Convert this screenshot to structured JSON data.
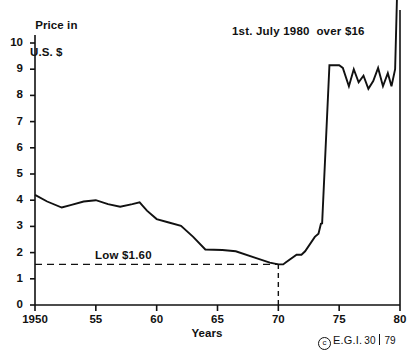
{
  "chart_data": {
    "type": "line",
    "title": "",
    "subtitle": "",
    "xlabel": "Years",
    "ylabel": "Price in U.S. $",
    "ylabel_line1": "Price in",
    "ylabel_line2": "U.S. $",
    "xlim": [
      1950,
      1980
    ],
    "ylim": [
      0,
      10
    ],
    "grid": false,
    "legend": "none",
    "ytick_labels": [
      "0",
      "1",
      "2",
      "3",
      "4",
      "5",
      "6",
      "7",
      "8",
      "9",
      "10"
    ],
    "ytick_values": [
      0,
      1,
      2,
      3,
      4,
      5,
      6,
      7,
      8,
      9,
      10
    ],
    "xtick_labels": [
      "1950",
      "55",
      "60",
      "65",
      "70",
      "75",
      "80"
    ],
    "xtick_values": [
      1950,
      1955,
      1960,
      1965,
      1970,
      1975,
      1980
    ],
    "series": [
      {
        "name": "Price in U.S. $",
        "color": "#111111",
        "x": [
          1950.0,
          1951.0,
          1952.2,
          1953.0,
          1954.0,
          1955.0,
          1956.0,
          1957.0,
          1958.0,
          1958.6,
          1959.2,
          1960.0,
          1961.0,
          1962.0,
          1963.0,
          1964.0,
          1965.4,
          1966.5,
          1968.0,
          1969.3,
          1970.0,
          1970.4,
          1970.6,
          1971.5,
          1971.9,
          1972.2,
          1973.0,
          1973.3,
          1973.5,
          1973.6,
          1974.2,
          1975.0,
          1975.3,
          1975.8,
          1976.2,
          1976.6,
          1977.0,
          1977.4,
          1977.8,
          1978.2,
          1978.6,
          1979.0,
          1979.3,
          1979.6,
          1980.0
        ],
        "y": [
          4.2,
          3.95,
          3.72,
          3.82,
          3.95,
          4.0,
          3.85,
          3.75,
          3.85,
          3.92,
          3.6,
          3.28,
          3.15,
          3.02,
          2.6,
          2.12,
          2.1,
          2.05,
          1.82,
          1.62,
          1.55,
          1.55,
          1.62,
          1.92,
          1.92,
          2.05,
          2.6,
          2.72,
          3.1,
          3.12,
          9.15,
          9.15,
          9.05,
          8.35,
          9.0,
          8.5,
          8.75,
          8.25,
          8.55,
          9.05,
          8.35,
          8.85,
          8.35,
          9.0,
          16.2
        ]
      }
    ],
    "reference_lines": [
      {
        "name": "low-price-line",
        "orientation": "horizontal",
        "value": 1.55,
        "style": "dashed",
        "label": "Low $1.60",
        "from_x": 1950,
        "to_x": 1970
      },
      {
        "name": "year-1970-line",
        "orientation": "vertical",
        "value": 1970,
        "style": "dashed",
        "label": "",
        "from_y": 0,
        "to_y": 1.55
      }
    ],
    "annotations": [
      {
        "name": "peak-annotation",
        "text": "1st. July 1980  over $16",
        "x": 1976.0,
        "y": 10.6
      },
      {
        "name": "low-annotation",
        "text": "Low $1.60",
        "x": 1955.0,
        "y": 2.1
      }
    ],
    "notes": {
      "low_value": "$1.60",
      "peak_value": "over $16",
      "peak_date": "1st. July 1980"
    }
  },
  "credit": {
    "copyright_symbol": "c",
    "organization": "E.G.I.",
    "plate_number": "30",
    "year": "79"
  },
  "colors": {
    "background": "#ffffff",
    "line": "#111111",
    "axis": "#111111",
    "text": "#111111"
  }
}
